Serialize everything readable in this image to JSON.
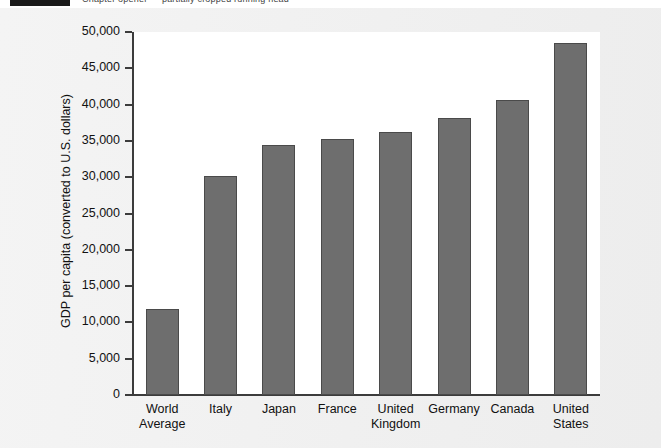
{
  "header": {
    "title": "Chapter opener — partially cropped running head",
    "tab_label": ""
  },
  "chart_data": {
    "type": "bar",
    "title": "",
    "xlabel": "",
    "ylabel": "GDP per capita (converted to U.S. dollars)",
    "categories": [
      "World\nAverage",
      "Italy",
      "Japan",
      "France",
      "United\nKingdom",
      "Germany",
      "Canada",
      "United\nStates"
    ],
    "values": [
      11800,
      30200,
      34500,
      35300,
      36200,
      38200,
      40700,
      48500
    ],
    "ylim": [
      0,
      50000
    ],
    "ytick_values": [
      0,
      5000,
      10000,
      15000,
      20000,
      25000,
      30000,
      35000,
      40000,
      45000,
      50000
    ],
    "ytick_labels": [
      "0",
      "5,000",
      "10,000",
      "15,000",
      "20,000",
      "25,000",
      "30,000",
      "35,000",
      "40,000",
      "45,000",
      "50,000"
    ],
    "grid": false,
    "legend": "none",
    "bar_color": "#6e6e6e",
    "bar_edge_color": "#4a4a4a",
    "plot_background": "#ffffff",
    "figure_background": "#f1f1f1"
  }
}
